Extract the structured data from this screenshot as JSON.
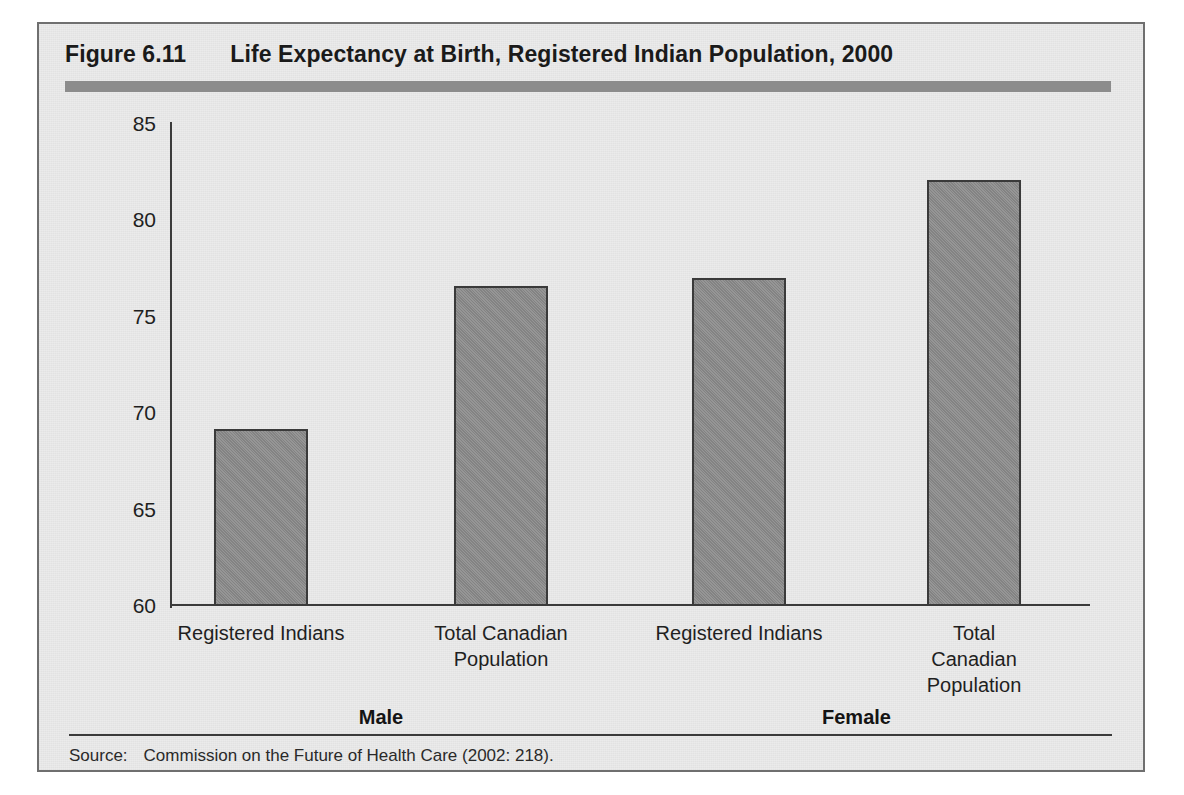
{
  "figure": {
    "number": "Figure 6.11",
    "title": "Life Expectancy at Birth, Registered Indian Population, 2000",
    "accent_color": "#8c8c8c",
    "frame_bg": "#ebebeb",
    "frame_border": "#6f6f6f"
  },
  "source": {
    "label": "Source:",
    "text": "Commission on the Future of Health Care (2002: 218)."
  },
  "axis": {
    "y_ticks": [
      "85",
      "80",
      "75",
      "70",
      "65",
      "60"
    ]
  },
  "groups": [
    {
      "label": "Male"
    },
    {
      "label": "Female"
    }
  ],
  "categories": [
    {
      "line1": "Registered Indians",
      "line2": ""
    },
    {
      "line1": "Total Canadian",
      "line2": "Population"
    },
    {
      "line1": "Registered Indians",
      "line2": ""
    },
    {
      "line1": "Total Canadian",
      "line2": "Population"
    }
  ],
  "chart_data": {
    "type": "bar",
    "title": "Life Expectancy at Birth, Registered Indian Population, 2000",
    "xlabel": "",
    "ylabel": "",
    "ylim": [
      60,
      85
    ],
    "yticks": [
      60,
      65,
      70,
      75,
      80,
      85
    ],
    "grid": false,
    "legend": "none",
    "bar_color": "#8a8a8a",
    "bar_edge_color": "#3a3a3a",
    "group_labels": [
      "Male",
      "Female"
    ],
    "categories": [
      "Registered Indians",
      "Total Canadian Population",
      "Registered Indians",
      "Total Canadian Population"
    ],
    "values": [
      69.2,
      76.6,
      77.0,
      82.1
    ],
    "series": [
      {
        "name": "Life expectancy at birth (years)",
        "values": [
          69.2,
          76.6,
          77.0,
          82.1
        ]
      }
    ],
    "points": [
      {
        "group": "Male",
        "category": "Registered Indians",
        "value": 69.2
      },
      {
        "group": "Male",
        "category": "Total Canadian Population",
        "value": 76.6
      },
      {
        "group": "Female",
        "category": "Registered Indians",
        "value": 77.0
      },
      {
        "group": "Female",
        "category": "Total Canadian Population",
        "value": 82.1
      }
    ]
  }
}
